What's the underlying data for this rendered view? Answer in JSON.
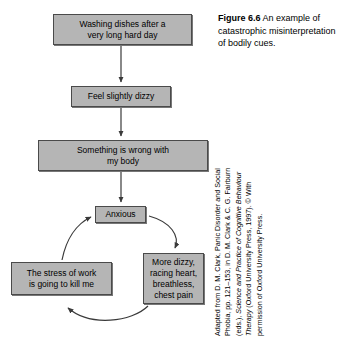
{
  "figure": {
    "caption_label": "Figure 6.6",
    "caption_text": " An example of catastrophic misinterpretation of bodily cues."
  },
  "nodes": {
    "washing": "Washing dishes after a\nvery long hard day",
    "dizzy": "Feel slightly dizzy",
    "wrong": "Something is wrong with\nmy body",
    "anxious": "Anxious",
    "stress": "The stress of work\nis going to kill me",
    "symptoms": "More dizzy,\nracing heart,\nbreathless,\nchest pain"
  },
  "attribution": {
    "line1": "Adapted from D. M. Clark, Panic Disorder and Social",
    "line2": "Phobia, pp. 121–153, in D. M. Clark & C. G. Fairburn",
    "line3_prefix": "(eds.), ",
    "line3_italic": "Science and Practice of Cognitive Behaviour",
    "line4_italic": "Therapy",
    "line4_rest": " (Oxford University Press, 1997). © With",
    "line5": "permission of Oxford University Press."
  },
  "colors": {
    "box_fill": "#b5b5b5",
    "box_border": "#4a4a4a",
    "arrow": "#3a3a3a",
    "text": "#000000",
    "background": "#ffffff"
  },
  "diagram": {
    "type": "flowchart",
    "title": "Catastrophic misinterpretation of bodily cues",
    "flow_sequence": [
      "Washing dishes after a very long hard day",
      "Feel slightly dizzy",
      "Something is wrong with my body",
      "Anxious"
    ],
    "vicious_cycle": [
      "Anxious",
      "More dizzy, racing heart, breathless, chest pain",
      "The stress of work is going to kill me",
      "Anxious"
    ]
  }
}
